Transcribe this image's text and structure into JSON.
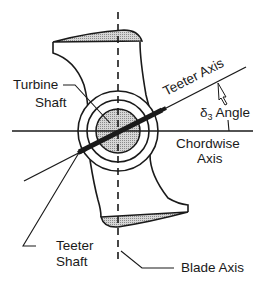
{
  "diagram": {
    "type": "wind-turbine-teeter-geometry",
    "labels": {
      "turbine_shaft_line1": "Turbine",
      "turbine_shaft_line2": "Shaft",
      "teeter_axis": "Teeter Axis",
      "delta3_symbol": "δ",
      "delta3_subscript": "3",
      "delta3_text": "Angle",
      "chordwise_line1": "Chordwise",
      "chordwise_line2": "Axis",
      "teeter_shaft_line1": "Teeter",
      "teeter_shaft_line2": "Shaft",
      "blade_axis": "Blade Axis"
    },
    "colors": {
      "line": "#1a1a1a",
      "shade": "#b8b8b8",
      "background": "#ffffff"
    }
  }
}
